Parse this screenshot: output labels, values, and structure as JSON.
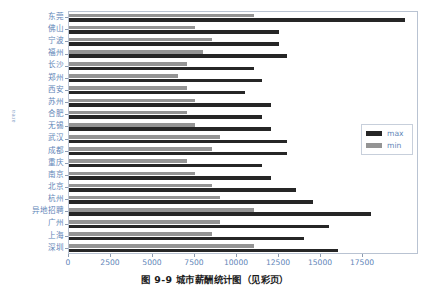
{
  "figure": {
    "caption": "图 9-9  城市薪酬统计图（见彩页）"
  },
  "chart_data": {
    "type": "bar",
    "orientation": "horizontal",
    "title": "",
    "xlabel": "",
    "ylabel": "area",
    "xlim": [
      0,
      20833
    ],
    "grid": false,
    "legend_position": "right-middle",
    "xticks": [
      0,
      2500,
      5000,
      7500,
      10000,
      12500,
      15000,
      17500
    ],
    "xtick_labels": [
      "0",
      "2500",
      "5000",
      "7500",
      "10000",
      "12500",
      "15000",
      "17500"
    ],
    "categories": [
      "东莞",
      "佛山",
      "宁波",
      "福州",
      "长沙",
      "郑州",
      "西安",
      "苏州",
      "合肥",
      "无锡",
      "武汉",
      "成都",
      "重庆",
      "南京",
      "北京",
      "杭州",
      "异地招聘",
      "广州",
      "上海",
      "深圳"
    ],
    "series": [
      {
        "name": "max",
        "color": "#262626",
        "values": [
          20000,
          12500,
          12500,
          13000,
          11000,
          11500,
          10500,
          12000,
          11500,
          12000,
          13000,
          13000,
          11500,
          12000,
          13500,
          14500,
          18000,
          15500,
          14000,
          16000
        ]
      },
      {
        "name": "min",
        "color": "#949494",
        "values": [
          11000,
          7500,
          8500,
          8000,
          7000,
          6500,
          7000,
          7500,
          7000,
          7500,
          9000,
          8500,
          7000,
          7500,
          8500,
          9000,
          11000,
          9000,
          8500,
          11000
        ]
      }
    ]
  },
  "legend": {
    "entries": [
      {
        "label": "max",
        "color": "#262626"
      },
      {
        "label": "min",
        "color": "#949494"
      }
    ]
  }
}
